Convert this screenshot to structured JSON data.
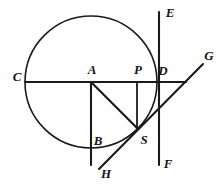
{
  "figure": {
    "canvas": {
      "width": 224,
      "height": 185
    },
    "stroke_color": "#1a1a1a",
    "background_color": "#ffffff"
  },
  "circle": {
    "name": "main-circle",
    "center_x": 91,
    "center_y": 82,
    "radius": 66
  },
  "points": [
    {
      "id": "C",
      "label": "C",
      "x": 25,
      "y": 82,
      "label_x": 17,
      "label_y": 76
    },
    {
      "id": "A",
      "label": "A",
      "x": 91,
      "y": 82,
      "label_x": 92,
      "label_y": 69
    },
    {
      "id": "P",
      "label": "P",
      "x": 137,
      "y": 82,
      "label_x": 138,
      "label_y": 69
    },
    {
      "id": "D",
      "label": "D",
      "x": 159,
      "y": 82,
      "label_x": 163,
      "label_y": 70
    },
    {
      "id": "E",
      "label": "E",
      "x": 159,
      "y": 13,
      "label_x": 170,
      "label_y": 12
    },
    {
      "id": "F",
      "label": "F",
      "x": 159,
      "y": 165,
      "label_x": 168,
      "label_y": 163
    },
    {
      "id": "G",
      "label": "G",
      "x": 203,
      "y": 64,
      "label_x": 209,
      "label_y": 55
    },
    {
      "id": "H",
      "label": "H",
      "x": 99,
      "y": 169,
      "label_x": 106,
      "label_y": 173
    },
    {
      "id": "S",
      "label": "S",
      "x": 137,
      "y": 128,
      "label_x": 144,
      "label_y": 139
    },
    {
      "id": "B",
      "label": "B",
      "x": 91,
      "y": 146,
      "label_x": 98,
      "label_y": 140
    }
  ],
  "segments": [
    {
      "name": "diameter-line-c-to-right",
      "from": [
        25,
        82
      ],
      "to": [
        186,
        82
      ]
    },
    {
      "name": "vertical-line-e-to-f",
      "from": [
        159,
        12
      ],
      "to": [
        159,
        165
      ]
    },
    {
      "name": "vertical-line-a-down",
      "from": [
        91,
        82
      ],
      "to": [
        91,
        165
      ]
    },
    {
      "name": "vertical-line-p-to-s",
      "from": [
        137,
        82
      ],
      "to": [
        137,
        128
      ]
    },
    {
      "name": "diagonal-line-a-to-s",
      "from": [
        91,
        82
      ],
      "to": [
        137,
        128
      ]
    },
    {
      "name": "secant-line-h-to-g",
      "from": [
        99,
        169
      ],
      "to": [
        203,
        64
      ]
    }
  ],
  "labels": {
    "C": "C",
    "A": "A",
    "P": "P",
    "D": "D",
    "E": "E",
    "F": "F",
    "G": "G",
    "H": "H",
    "S": "S",
    "B": "B"
  }
}
